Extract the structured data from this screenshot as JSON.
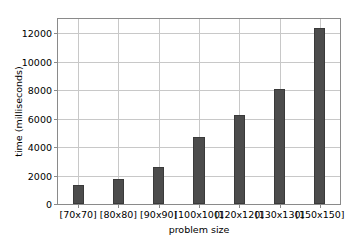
{
  "chart_data": {
    "type": "bar",
    "title": "",
    "subtitle": "",
    "xlabel": "problem size",
    "ylabel": "time (milliseconds)",
    "categories": [
      "[70x70]",
      "[80x80]",
      "[90x90]",
      "[100x100]",
      "[120x120]",
      "[130x130]",
      "[150x150]"
    ],
    "values": [
      1350,
      1750,
      2620,
      4680,
      6250,
      8050,
      12400
    ],
    "ylim": [
      0,
      13000
    ],
    "yticks": [
      0,
      2000,
      4000,
      6000,
      8000,
      10000,
      12000
    ],
    "ytick_labels": [
      "0",
      "2000",
      "4000",
      "6000",
      "8000",
      "10000",
      "12000"
    ],
    "grid": true,
    "grid_axis": "both",
    "legend": null,
    "legend_position": "none",
    "annotations": [],
    "bar_color": "#4c4c4c",
    "bar_edge_color": "#3a3a3a",
    "grid_color": "#c8c8c8",
    "frame_color": "#8a8a8a",
    "background_color": "#ffffff"
  }
}
